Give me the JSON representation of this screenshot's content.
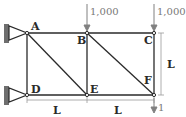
{
  "diagram": {
    "type": "truss",
    "nodes": [
      {
        "id": "A",
        "label": "A",
        "x": 27,
        "y": 33
      },
      {
        "id": "B",
        "label": "B",
        "x": 87,
        "y": 33
      },
      {
        "id": "C",
        "label": "C",
        "x": 154,
        "y": 33
      },
      {
        "id": "D",
        "label": "D",
        "x": 27,
        "y": 95
      },
      {
        "id": "E",
        "label": "E",
        "x": 87,
        "y": 95
      },
      {
        "id": "F",
        "label": "F",
        "x": 154,
        "y": 95
      }
    ],
    "members": [
      [
        "A",
        "B"
      ],
      [
        "B",
        "C"
      ],
      [
        "D",
        "E"
      ],
      [
        "E",
        "F"
      ],
      [
        "A",
        "D"
      ],
      [
        "B",
        "E"
      ],
      [
        "C",
        "F"
      ],
      [
        "A",
        "E"
      ],
      [
        "B",
        "F"
      ]
    ],
    "supports": [
      {
        "node": "A",
        "type": "pin"
      },
      {
        "node": "D",
        "type": "pin"
      }
    ],
    "loads": [
      {
        "node": "B",
        "label": "1,000",
        "direction": "down"
      },
      {
        "node": "C",
        "label": "1,000",
        "direction": "down"
      },
      {
        "node": "F",
        "label": "1",
        "direction": "down"
      }
    ],
    "dimensions": [
      {
        "label": "L",
        "between": [
          "D",
          "E"
        ],
        "orientation": "horizontal"
      },
      {
        "label": "L",
        "between": [
          "E",
          "F"
        ],
        "orientation": "horizontal"
      },
      {
        "label": "L",
        "between": [
          "C",
          "F"
        ],
        "orientation": "vertical"
      }
    ]
  },
  "labels": {
    "A": "A",
    "B": "B",
    "C": "C",
    "D": "D",
    "E": "E",
    "F": "F",
    "load_B": "1,000",
    "load_C": "1,000",
    "load_F": "1",
    "dim_DE": "L",
    "dim_EF": "L",
    "dim_CF": "L"
  },
  "colors": {
    "member": "#2a2a2a",
    "load": "#808080",
    "support": "#6e6e6e"
  }
}
